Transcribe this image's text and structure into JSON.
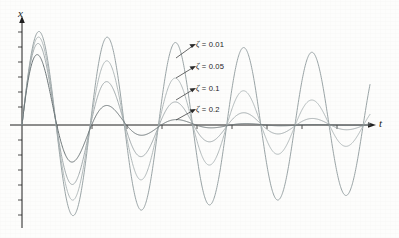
{
  "chart_data": {
    "type": "line",
    "title": "",
    "subtitle": "",
    "xlabel": "t",
    "ylabel": "x",
    "grid": false,
    "legend_position": "inline-annotations",
    "axis_style": {
      "x_axis_arrow": true,
      "y_axis_arrow": true,
      "x_axis_ticks": true,
      "y_axis_ticks": true,
      "tick_count_x": 10,
      "tick_count_y": 12
    },
    "xlim": [
      0,
      10.2
    ],
    "ylim": [
      -1.05,
      1.05
    ],
    "period": 2.0,
    "series": [
      {
        "name": "zeta = 0.01",
        "label": "ζ = 0.01",
        "zeta": 0.01,
        "color": "#8f9a9c",
        "stroke_width": 0.9,
        "x": [
          0,
          0.5,
          1,
          1.5,
          2,
          2.5,
          3,
          3.5,
          4,
          4.5,
          5,
          5.5,
          6,
          6.5,
          7,
          7.5,
          8,
          8.5,
          9,
          9.5,
          10
        ],
        "values": [
          0,
          0.985,
          0,
          -0.954,
          0,
          0.924,
          0,
          -0.895,
          0,
          0.867,
          0,
          -0.84,
          0,
          0.814,
          0,
          -0.788,
          0,
          0.763,
          0,
          -0.739,
          0
        ]
      },
      {
        "name": "zeta = 0.05",
        "label": "ζ = 0.05",
        "zeta": 0.05,
        "color": "#a9b2b3",
        "stroke_width": 0.9,
        "x": [
          0,
          0.5,
          1,
          1.5,
          2,
          2.5,
          3,
          3.5,
          4,
          4.5,
          5,
          5.5,
          6,
          6.5,
          7,
          7.5,
          8,
          8.5,
          9,
          9.5,
          10
        ],
        "values": [
          0,
          0.924,
          0,
          -0.79,
          0,
          0.675,
          0,
          -0.577,
          0,
          0.493,
          0,
          -0.422,
          0,
          0.36,
          0,
          -0.308,
          0,
          0.263,
          0,
          -0.225,
          0
        ]
      },
      {
        "name": "zeta = 0.1",
        "label": "ζ = 0.1",
        "zeta": 0.1,
        "color": "#9aa3a5",
        "stroke_width": 0.9,
        "x": [
          0,
          0.5,
          1,
          1.5,
          2,
          2.5,
          3,
          3.5,
          4,
          4.5,
          5,
          5.5,
          6,
          6.5,
          7,
          7.5,
          8,
          8.5,
          9,
          9.5,
          10
        ],
        "values": [
          0,
          0.854,
          0,
          -0.625,
          0,
          0.457,
          0,
          -0.335,
          0,
          0.245,
          0,
          -0.179,
          0,
          0.131,
          0,
          -0.096,
          0,
          0.07,
          0,
          -0.051,
          0
        ]
      },
      {
        "name": "zeta = 0.2",
        "label": "ζ = 0.2",
        "zeta": 0.2,
        "color": "#6c7577",
        "stroke_width": 1.0,
        "x": [
          0,
          0.5,
          1,
          1.5,
          2,
          2.5,
          3,
          3.5,
          4,
          4.5,
          5,
          5.5,
          6,
          6.5,
          7,
          7.5,
          8,
          8.5,
          9,
          9.5,
          10
        ],
        "values": [
          0,
          0.729,
          0,
          -0.417,
          0,
          0.239,
          0,
          -0.137,
          0,
          0.078,
          0,
          -0.045,
          0,
          0.026,
          0,
          -0.015,
          0,
          0.008,
          0,
          -0.005,
          0
        ]
      }
    ],
    "annotations": [
      {
        "text": "ζ = 0.01",
        "target_series": "zeta = 0.01"
      },
      {
        "text": "ζ = 0.05",
        "target_series": "zeta = 0.05"
      },
      {
        "text": "ζ = 0.1",
        "target_series": "zeta = 0.1"
      },
      {
        "text": "ζ = 0.2",
        "target_series": "zeta = 0.2"
      }
    ]
  },
  "axes": {
    "y_label": "x",
    "x_label": "t"
  },
  "labels": {
    "zeta_001": "= 0.01",
    "zeta_005": "= 0.05",
    "zeta_01": "= 0.1",
    "zeta_02": "= 0.2",
    "zeta_symbol": "ζ"
  },
  "colors": {
    "axis": "#1f1f1f",
    "background": "#fdfdfc",
    "text": "#1c1c1c"
  }
}
